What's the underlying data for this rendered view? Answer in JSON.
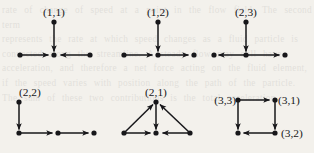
{
  "figure": {
    "kind": "directed-graph-panel-set",
    "background_color": "#f3f1ec",
    "ink_color": "#17171a",
    "ghost_text": "rate of change of speed at a point in the flow field. The second term\nrepresents the rate at which speed changes as a fluid particle is\nconvected along the streamline. A steady flow may still have\nacceleration, and therefore a net force acting on the fluid element,\nif the speed varies with position along the path of the particle.\nThe sum of these two contributions is the total acceleration.",
    "panels": [
      {
        "id": "panel-1-1",
        "label": "(1,1)",
        "shape": "star-in",
        "description": "top node and both side nodes point inward to the centre node"
      },
      {
        "id": "panel-1-2",
        "label": "(1,2)",
        "shape": "path-right",
        "description": "left node and top node point into centre; centre points right into right node"
      },
      {
        "id": "panel-2-3",
        "label": "(2,3)",
        "shape": "fan-out-sides",
        "description": "centre points left into left node and right into right node; top node points down into centre"
      },
      {
        "id": "panel-2-2",
        "label": "(2,2)",
        "shape": "corner-chain",
        "description": "top-left node points down into corner node; corner points right into middle node which points right into end node"
      },
      {
        "id": "panel-2-1",
        "label": "(2,1)",
        "shape": "triangle-in",
        "description": "both base nodes point up into apex; apex points down into base centre; both base nodes point into base centre"
      },
      {
        "id": "panel-3-3",
        "label": "(3,3)",
        "shape": "square-cycle",
        "node_labels": [
          "(3,3)",
          "(3,1)",
          "(3,2)"
        ],
        "description": "square: top-left to top-right, top-left down to bottom-left, top-right down to bottom-right, bottom-right left to bottom-left"
      }
    ],
    "labels": {
      "p1": "(1,1)",
      "p2": "(1,2)",
      "p3": "(2,3)",
      "p4": "(2,2)",
      "p5": "(2,1)",
      "p6_topleft": "(3,3)",
      "p6_topright": "(3,1)",
      "p6_bottomright": "(3,2)"
    }
  }
}
